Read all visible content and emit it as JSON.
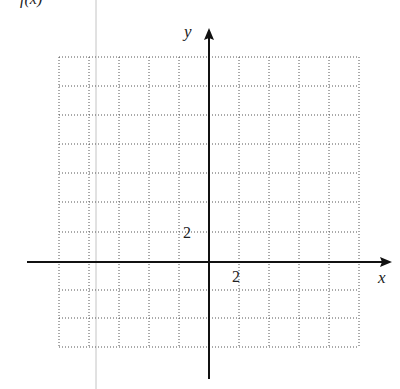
{
  "header_partial": "f(x)",
  "axes": {
    "x_label": "x",
    "y_label": "y",
    "x_tick_label": "2",
    "y_tick_label": "2"
  },
  "grid": {
    "columns": 10,
    "rows": 10,
    "style": "dotted"
  },
  "colors": {
    "axis": "#111111",
    "grid": "#555555",
    "margin_line": "#bbbbbb"
  }
}
